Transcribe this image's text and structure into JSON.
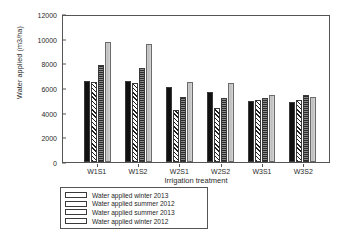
{
  "chart_data": {
    "type": "bar",
    "title": "",
    "xlabel": "Irrigation treatment",
    "ylabel": "Water applied (m3/ha)",
    "categories": [
      "W1S1",
      "W1S2",
      "W2S1",
      "W2S2",
      "W3S1",
      "W3S2"
    ],
    "ylim": [
      0,
      12000
    ],
    "yticks": [
      0,
      2000,
      4000,
      6000,
      8000,
      10000,
      12000
    ],
    "ytick_labels": [
      "0",
      "2000",
      "4000",
      "6000",
      "8000",
      "10000",
      "12000"
    ],
    "grid": false,
    "legend_position": "below-left",
    "series": [
      {
        "name": "Water applied summer 2012",
        "pattern": "solid-black",
        "values": [
          6600,
          6600,
          6050,
          5650,
          4950,
          4900
        ]
      },
      {
        "name": "Water applied summer 2013",
        "pattern": "diagonal-hatch",
        "values": [
          6450,
          6400,
          4250,
          4350,
          5050,
          5050
        ]
      },
      {
        "name": "Water applied winter 2012",
        "pattern": "dark-dotted",
        "values": [
          7900,
          7650,
          5250,
          5150,
          5200,
          5450
        ]
      },
      {
        "name": "Water applied winter 2013",
        "pattern": "light-gray",
        "values": [
          9750,
          9600,
          6500,
          6400,
          5450,
          5300
        ]
      }
    ]
  },
  "legend": {
    "entries": [
      {
        "label": "Water applied winter 2013",
        "pattern": "light-gray"
      },
      {
        "label": "Water applied summer 2012",
        "pattern": "solid-black"
      },
      {
        "label": "Water applied summer 2013",
        "pattern": "diagonal-hatch"
      },
      {
        "label": "Water applied winter 2012",
        "pattern": "dark-dotted"
      }
    ]
  },
  "caption": ""
}
